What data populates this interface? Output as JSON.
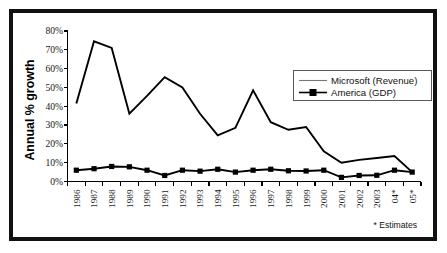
{
  "chart_data": {
    "type": "line",
    "title": "",
    "xlabel": "",
    "ylabel": "Annual % growth",
    "ylim": [
      0,
      80
    ],
    "ytick_labels": [
      "0%",
      "10%",
      "20%",
      "30%",
      "40%",
      "50%",
      "60%",
      "70%",
      "80%"
    ],
    "ytick_values": [
      0,
      10,
      20,
      30,
      40,
      50,
      60,
      70,
      80
    ],
    "grid": false,
    "legend_position": "upper right",
    "categories": [
      "1986",
      "1987",
      "1988",
      "1989",
      "1990",
      "1991",
      "1992",
      "1993",
      "1994",
      "1995",
      "1996",
      "1997",
      "1998",
      "1999",
      "2000",
      "2001",
      "2002",
      "2003",
      "04*",
      "05*"
    ],
    "series": [
      {
        "name": "Microsoft (Revenue)",
        "marker": "none",
        "values": [
          41.5,
          74.5,
          71.0,
          36.0,
          45.5,
          55.5,
          50.0,
          36.0,
          24.5,
          28.5,
          48.5,
          31.5,
          27.5,
          29.0,
          16.0,
          10.0,
          11.5,
          12.5,
          13.5,
          5.0
        ]
      },
      {
        "name": "America (GDP)",
        "marker": "square",
        "values": [
          6.0,
          6.8,
          8.0,
          7.8,
          6.0,
          3.2,
          6.0,
          5.5,
          6.5,
          5.0,
          6.0,
          6.5,
          5.7,
          5.6,
          6.0,
          2.2,
          3.2,
          3.3,
          6.0,
          5.0
        ]
      }
    ],
    "annotations": [
      {
        "name": "estimates-note",
        "text": "* Estimates"
      }
    ]
  },
  "colors": {
    "frame": "#111111",
    "axis": "#000000",
    "series_microsoft": "#000000",
    "series_america": "#000000",
    "background": "#ffffff",
    "legend_border": "#5a5a5a"
  },
  "legend": {
    "items": [
      {
        "label": "Microsoft (Revenue)",
        "marker": "line"
      },
      {
        "label": "America (GDP)",
        "marker": "line-square"
      }
    ]
  },
  "axes": {
    "y_title": "Annual % growth"
  }
}
